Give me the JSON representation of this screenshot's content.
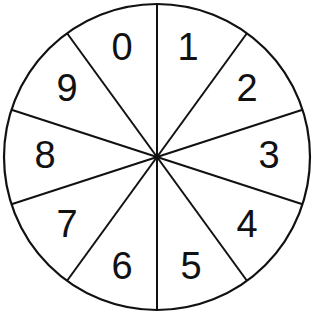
{
  "diagram": {
    "type": "spinner",
    "sector_count": 10,
    "center": [
      157,
      155
    ],
    "radius": 154,
    "stroke_color": "#111111",
    "background": "#ffffff",
    "labels": [
      {
        "text": "0",
        "x": 122,
        "y": 60
      },
      {
        "text": "1",
        "x": 188,
        "y": 60
      },
      {
        "text": "2",
        "x": 247,
        "y": 101
      },
      {
        "text": "3",
        "x": 269,
        "y": 168
      },
      {
        "text": "4",
        "x": 247,
        "y": 237
      },
      {
        "text": "5",
        "x": 191,
        "y": 279
      },
      {
        "text": "6",
        "x": 122,
        "y": 279
      },
      {
        "text": "7",
        "x": 67,
        "y": 237
      },
      {
        "text": "8",
        "x": 45,
        "y": 168
      },
      {
        "text": "9",
        "x": 67,
        "y": 101
      }
    ]
  }
}
